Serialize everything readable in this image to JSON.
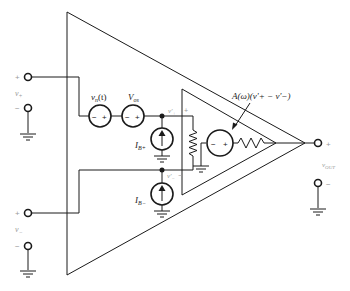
{
  "diagram": {
    "inputs": {
      "v_plus": {
        "label": "v+",
        "plus_sign": "+",
        "minus_sign": "−"
      },
      "v_minus": {
        "label": "v−",
        "plus_sign": "+",
        "minus_sign": "−"
      }
    },
    "sources": {
      "noise": {
        "label": "vn(t)",
        "label_main": "v",
        "label_sub": "n",
        "label_arg": "(t)",
        "minus": "−",
        "plus": "+"
      },
      "offset": {
        "label": "Vos",
        "label_main": "V",
        "label_sub": "os",
        "minus": "−",
        "plus": "+"
      },
      "bias_plus": {
        "label": "IB+",
        "label_main": "I",
        "label_sub": "B+"
      },
      "bias_minus": {
        "label": "IB−",
        "label_main": "I",
        "label_sub": "B−"
      },
      "dependent": {
        "label": "A(ω)(v'+ − v'−)",
        "minus": "−",
        "plus": "+"
      }
    },
    "nodes": {
      "v_plus_prime": {
        "label": "v'+",
        "plus_sign": "+"
      },
      "v_minus_prime": {
        "label": "v'−",
        "minus_sign": "−"
      }
    },
    "output": {
      "label": "vout",
      "label_main": "v",
      "label_sub": "OUT",
      "plus_sign": "+",
      "minus_sign": "−"
    }
  }
}
